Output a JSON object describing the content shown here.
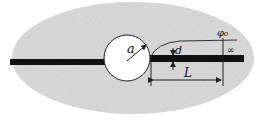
{
  "diagram": {
    "type": "schematic",
    "labels": {
      "radius": "a",
      "thickness": "d",
      "length": "L",
      "field": "φ₀",
      "far_field": "∞"
    },
    "colors": {
      "background": "#ffffff",
      "region_fill": "#d9d9d9",
      "bar": "#111111",
      "hole": "#ffffff",
      "lines": "#222222"
    }
  }
}
